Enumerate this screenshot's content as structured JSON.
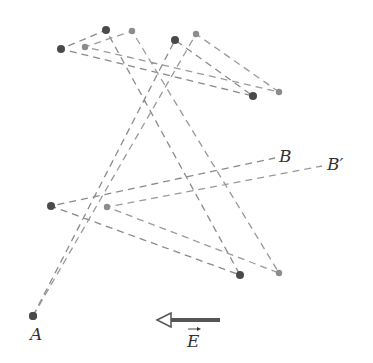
{
  "diagram": {
    "labels": {
      "start": "A",
      "end_no_field": "B",
      "end_with_field": "B′",
      "field": "E"
    },
    "colors": {
      "dark_dot": "#4a4a4a",
      "light_dot": "#8c8c8c",
      "dash": "#8a8a8a",
      "field_arrow": "#555555"
    },
    "paths": [
      {
        "name": "path-without-field",
        "style": "dark",
        "points": [
          [
            33,
            316
          ],
          [
            175,
            40
          ],
          [
            253,
            96
          ],
          [
            61,
            49
          ],
          [
            106,
            30
          ],
          [
            240,
            275
          ],
          [
            51,
            206
          ],
          [
            275,
            158
          ]
        ]
      },
      {
        "name": "path-with-field",
        "style": "light",
        "points": [
          [
            33,
            316
          ],
          [
            196,
            34
          ],
          [
            279,
            92
          ],
          [
            85,
            47
          ],
          [
            132,
            31
          ],
          [
            279,
            273
          ],
          [
            107,
            207
          ],
          [
            322,
            166
          ]
        ]
      }
    ],
    "field_arrow": {
      "from": [
        220,
        320
      ],
      "to": [
        157,
        320
      ],
      "direction": "left"
    }
  }
}
